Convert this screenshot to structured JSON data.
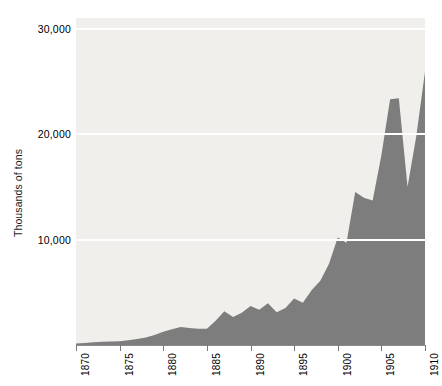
{
  "chart_data": {
    "type": "area",
    "title": "",
    "subtitle": "",
    "xlabel": "",
    "ylabel": "Thousands of tons",
    "xlim": [
      1870,
      1910
    ],
    "ylim": [
      0,
      31000
    ],
    "grid": true,
    "legend": null,
    "legend_position": "none",
    "y_ticks": [
      10000,
      20000,
      30000
    ],
    "y_tick_labels": [
      "10,000",
      "20,000",
      "30,000"
    ],
    "x_ticks": [
      1870,
      1875,
      1880,
      1885,
      1890,
      1895,
      1900,
      1905,
      1910
    ],
    "x_tick_labels": [
      "1870",
      "1875",
      "1880",
      "1885",
      "1890",
      "1895",
      "1900",
      "1905",
      "1910"
    ],
    "series": [
      {
        "name": "Output",
        "x": [
          1870,
          1871,
          1872,
          1873,
          1874,
          1875,
          1876,
          1877,
          1878,
          1879,
          1880,
          1881,
          1882,
          1883,
          1884,
          1885,
          1886,
          1887,
          1888,
          1889,
          1890,
          1891,
          1892,
          1893,
          1894,
          1895,
          1896,
          1897,
          1898,
          1899,
          1900,
          1901,
          1902,
          1903,
          1904,
          1905,
          1906,
          1907,
          1908,
          1909,
          1910
        ],
        "values": [
          150,
          200,
          250,
          300,
          320,
          350,
          450,
          560,
          700,
          950,
          1250,
          1500,
          1700,
          1600,
          1550,
          1550,
          2300,
          3200,
          2650,
          3050,
          3700,
          3350,
          3950,
          3100,
          3500,
          4400,
          4000,
          5200,
          6100,
          7700,
          10200,
          9700,
          14500,
          13950,
          13700,
          18000,
          23300,
          23400,
          15000,
          19800,
          25900
        ],
        "color": "#7d7d7d"
      }
    ],
    "colors": {
      "area_fill": "#7d7d7d",
      "plot_background": "#f0efec",
      "gridline": "#ffffff",
      "axis": "#8a8a8a",
      "text": "#000000",
      "page_background": "#ffffff"
    }
  }
}
